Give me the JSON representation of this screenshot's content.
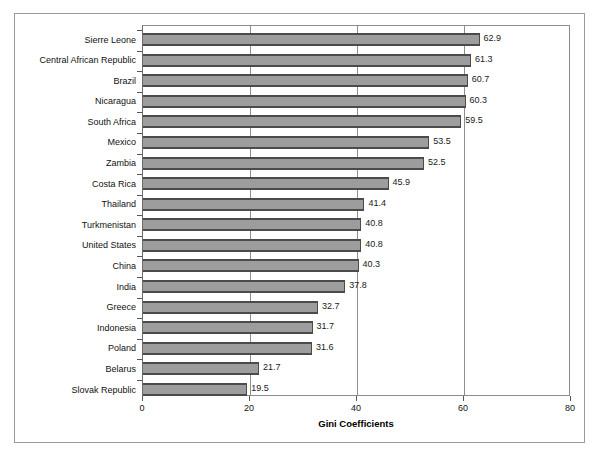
{
  "chart_data": {
    "type": "bar",
    "orientation": "horizontal",
    "title": "",
    "xlabel": "Gini Coefficients",
    "ylabel": "",
    "xlim": [
      0,
      80
    ],
    "xticks": [
      "0",
      "20",
      "40",
      "60",
      "80"
    ],
    "xtick_values": [
      0,
      20,
      40,
      60,
      80
    ],
    "grid": true,
    "grid_axis": "x",
    "legend": false,
    "bar_color": "#9d9d9d",
    "bar_edge_color": "#4b4b4b",
    "categories": [
      "Sierre Leone",
      "Central African Republic",
      "Brazil",
      "Nicaragua",
      "South Africa",
      "Mexico",
      "Zambia",
      "Costa Rica",
      "Thailand",
      "Turkmenistan",
      "United States",
      "China",
      "India",
      "Greece",
      "Indonesia",
      "Poland",
      "Belarus",
      "Slovak Republic"
    ],
    "values": [
      62.9,
      61.3,
      60.7,
      60.3,
      59.5,
      53.5,
      52.5,
      45.9,
      41.4,
      40.8,
      40.8,
      40.3,
      37.8,
      32.7,
      31.7,
      31.6,
      21.7,
      19.5
    ],
    "data_labels": [
      "62.9",
      "61.3",
      "60.7",
      "60.3",
      "59.5",
      "53.5",
      "52.5",
      "45.9",
      "41.4",
      "40.8",
      "40.8",
      "40.3",
      "37.8",
      "32.7",
      "31.7",
      "31.6",
      "21.7",
      "19.5"
    ]
  }
}
